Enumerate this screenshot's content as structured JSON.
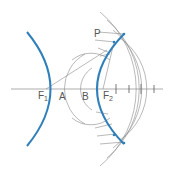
{
  "diagram": {
    "colors": {
      "curve": "#2f7fba",
      "construction": "#8a8a8a",
      "label": "#555555",
      "background": "#ffffff"
    },
    "labels": {
      "F1": {
        "main": "F",
        "sub": "1"
      },
      "A": "A",
      "B": "B",
      "F2": {
        "main": "F",
        "sub": "2"
      },
      "P": "P"
    }
  }
}
